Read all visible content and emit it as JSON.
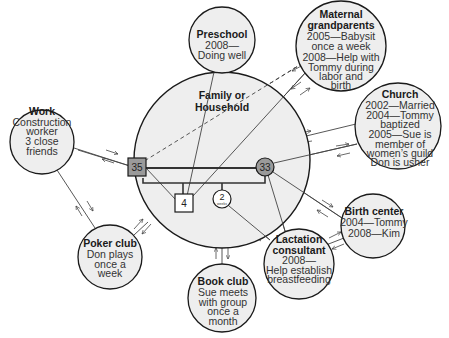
{
  "diagram": {
    "type": "ecomap",
    "colors": {
      "circle_fill": "#eeeeee",
      "circle_stroke": "#1a1a1a",
      "member_fill_gray": "#9a9a9a",
      "member_fill_white": "#ffffff",
      "line": "#444444"
    },
    "family": {
      "title_line1": "Family or",
      "title_line2": "Household",
      "members": [
        {
          "id": "father",
          "shape": "square",
          "label": "35",
          "fill": "gray"
        },
        {
          "id": "mother",
          "shape": "circle",
          "label": "33",
          "fill": "gray"
        },
        {
          "id": "son",
          "shape": "square",
          "label": "4",
          "fill": "white"
        },
        {
          "id": "daughter",
          "shape": "circle",
          "label": "2",
          "sublabel": "weeks",
          "fill": "white"
        }
      ]
    },
    "systems": {
      "work": {
        "title": "Work",
        "lines": [
          "Construction",
          "worker",
          "3 close",
          "friends"
        ]
      },
      "preschool": {
        "title": "Preschool",
        "lines": [
          "2008—",
          "Doing well"
        ]
      },
      "grandparents": {
        "title_lines": [
          "Maternal",
          "grandparents"
        ],
        "lines": [
          "2005—Babysit",
          "once a week",
          "2008—Help with",
          "Tommy during",
          "labor and",
          "birth"
        ]
      },
      "church": {
        "title": "Church",
        "lines": [
          "2002—Married",
          "2004—Tommy",
          "baptized",
          "2005—Sue is",
          "member of",
          "women’s guild",
          "Don is usher"
        ]
      },
      "birth_center": {
        "title": "Birth center",
        "lines": [
          "2004—Tommy",
          "2008—Kim"
        ]
      },
      "lactation": {
        "title_lines": [
          "Lactation",
          "consultant"
        ],
        "lines": [
          "2008—",
          "Help establish",
          "breastfeeding"
        ]
      },
      "book_club": {
        "title": "Book club",
        "lines": [
          "Sue meets",
          "with group",
          "once a",
          "month"
        ]
      },
      "poker_club": {
        "title": "Poker club",
        "lines": [
          "Don plays",
          "once a",
          "week"
        ]
      }
    },
    "connections": [
      {
        "from": "work",
        "to": "father",
        "style": "solid",
        "flow": "bidirectional"
      },
      {
        "from": "work",
        "to": "poker_club",
        "style": "solid",
        "flow": "bidirectional"
      },
      {
        "from": "poker_club",
        "to": "family",
        "style": "solid",
        "flow": "bidirectional"
      },
      {
        "from": "preschool",
        "to": "son",
        "style": "solid",
        "flow": "bidirectional"
      },
      {
        "from": "grandparents",
        "to": "father",
        "style": "dashed",
        "flow": "bidirectional"
      },
      {
        "from": "grandparents",
        "to": "son",
        "style": "solid",
        "flow": "bidirectional"
      },
      {
        "from": "church",
        "to": "family",
        "style": "solid",
        "flow": "bidirectional"
      },
      {
        "from": "church",
        "to": "mother",
        "style": "solid",
        "flow": "bidirectional"
      },
      {
        "from": "birth_center",
        "to": "mother",
        "style": "solid",
        "flow": "bidirectional"
      },
      {
        "from": "lactation",
        "to": "mother",
        "style": "solid",
        "flow": "bidirectional"
      },
      {
        "from": "lactation",
        "to": "daughter",
        "style": "solid",
        "flow": "to-family"
      },
      {
        "from": "lactation",
        "to": "birth_center",
        "style": "solid",
        "flow": "bidirectional"
      },
      {
        "from": "book_club",
        "to": "family",
        "style": "solid",
        "flow": "bidirectional"
      },
      {
        "from": "father",
        "to": "son",
        "style": "solid",
        "flow": "none"
      }
    ]
  }
}
